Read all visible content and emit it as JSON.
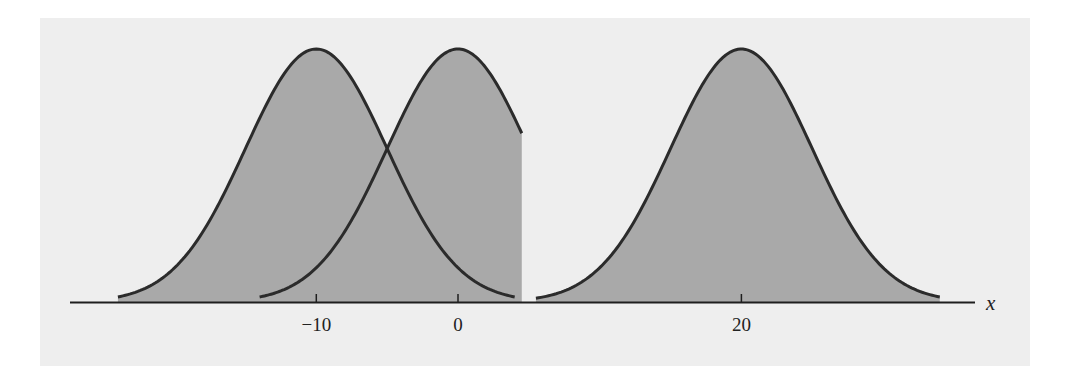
{
  "chart_data": {
    "type": "area",
    "title": "",
    "subtitle": "",
    "xlabel": "x",
    "ylabel": "",
    "x_ticks": [
      -10,
      0,
      20
    ],
    "x_tick_labels": [
      "−10",
      "0",
      "20"
    ],
    "xlim": [
      -22.5,
      36.5
    ],
    "grid": false,
    "legend": null,
    "series": [
      {
        "name": "normal curve, mean -10",
        "distribution": "normal",
        "mean": -10,
        "sd": 5,
        "x_range": [
          -24,
          4
        ],
        "filled": true
      },
      {
        "name": "normal curve, mean 0",
        "distribution": "normal",
        "mean": 0,
        "sd": 5,
        "x_range": [
          -14,
          4.5
        ],
        "filled": true
      },
      {
        "name": "normal curve, mean 20",
        "distribution": "normal",
        "mean": 20,
        "sd": 5,
        "x_range": [
          5.5,
          34
        ],
        "filled": true
      }
    ],
    "annotations": []
  },
  "axis": {
    "label": "x",
    "ticks": [
      {
        "value": -10,
        "label": "−10"
      },
      {
        "value": 0,
        "label": "0"
      },
      {
        "value": 20,
        "label": "20"
      }
    ]
  },
  "colors": {
    "page_background": "#ffffff",
    "panel_background": "#eeeeee",
    "fill": "#a9a9a9",
    "stroke": "#2b2b2b",
    "axis": "#1e1e1e"
  }
}
